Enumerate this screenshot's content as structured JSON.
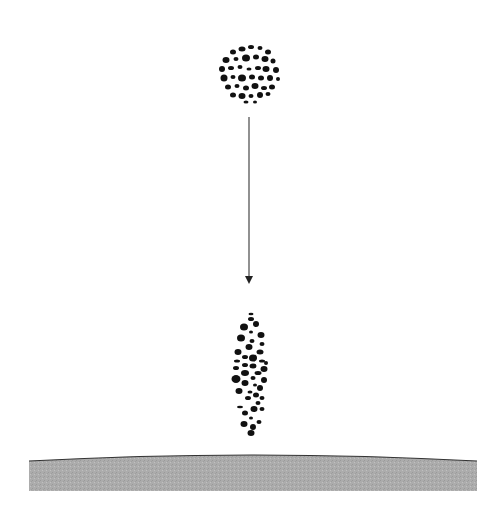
{
  "diagram": {
    "elements": [
      {
        "id": "initial-droplet-cluster",
        "shape": "circular cluster of dots",
        "center": [
          249,
          75
        ]
      },
      {
        "id": "fall-arrow",
        "direction": "down",
        "from": [
          249,
          117
        ],
        "to": [
          249,
          283
        ]
      },
      {
        "id": "elongated-droplet-cluster",
        "shape": "vertically elongated cluster of dots",
        "center": [
          249,
          375
        ]
      },
      {
        "id": "ground-surface",
        "shape": "slightly curved band",
        "fill": "#a8a8a8"
      }
    ]
  },
  "colors": {
    "background": "#ffffff",
    "dots": "#111111",
    "arrow": "#555555",
    "ground_fill": "#a9a9a9",
    "ground_edge": "#333333"
  }
}
